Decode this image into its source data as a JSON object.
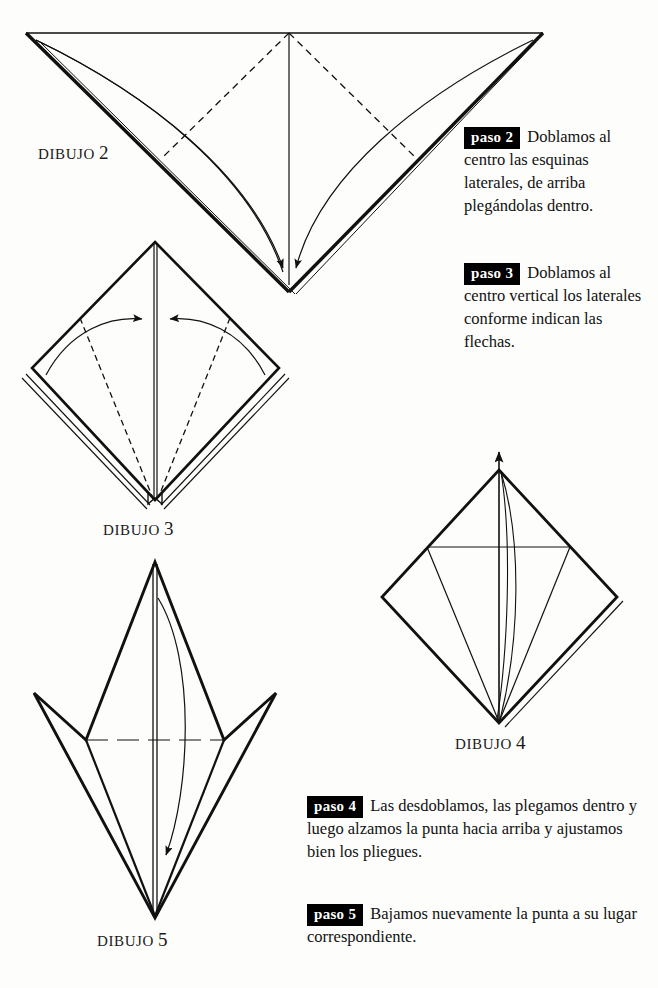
{
  "page": {
    "background_color": "#fdfdfb",
    "ink_color": "#111111",
    "badge_background": "#000000",
    "badge_text_color": "#ffffff",
    "language": "es"
  },
  "figures": [
    {
      "id": "dibujo-2",
      "caption_word": "DIBUJO",
      "caption_number": "2",
      "description": "Triangulo invertido con pliegues punteados y dos flechas curvas hacia la punta inferior"
    },
    {
      "id": "dibujo-3",
      "caption_word": "DIBUJO",
      "caption_number": "3",
      "description": "Rombo con lineas punteadas y dos flechas curvas hacia el centro vertical"
    },
    {
      "id": "dibujo-4",
      "caption_word": "DIBUJO",
      "caption_number": "4",
      "description": "Rombo con pliegue horizontal y flecha pequena hacia arriba en la punta"
    },
    {
      "id": "dibujo-5",
      "caption_word": "DIBUJO",
      "caption_number": "5",
      "description": "Cometa alargada con flecha curva descendente"
    }
  ],
  "steps": [
    {
      "id": "paso-2",
      "badge": "paso 2",
      "text": "Doblamos al centro las esquinas laterales, de arriba plegándolas dentro."
    },
    {
      "id": "paso-3",
      "badge": "paso 3",
      "text": "Doblamos al centro vertical los laterales conforme indican las flechas."
    },
    {
      "id": "paso-4",
      "badge": "paso 4",
      "text": "Las desdoblamos, las plegamos dentro y luego alzamos la punta hacia arriba y ajustamos bien los pliegues."
    },
    {
      "id": "paso-5",
      "badge": "paso 5",
      "text": "Bajamos nuevamente la punta a su lugar correspondiente."
    }
  ]
}
